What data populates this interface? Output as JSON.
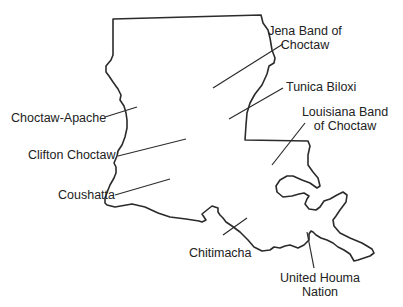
{
  "map": {
    "subject": "Louisiana",
    "line_color": "#2b2b2b",
    "label_color": "#222222",
    "labels": [
      {
        "id": "jena",
        "line1": "Jena Band of",
        "line2": "Choctaw"
      },
      {
        "id": "tunica",
        "line1": "Tunica Biloxi"
      },
      {
        "id": "louisiana-band",
        "line1": "Louisiana Band",
        "line2": "of Choctaw"
      },
      {
        "id": "choctaw-apache",
        "line1": "Choctaw-Apache"
      },
      {
        "id": "clifton",
        "line1": "Clifton Choctaw"
      },
      {
        "id": "coushatta",
        "line1": "Coushatta"
      },
      {
        "id": "chitimacha",
        "line1": "Chitimacha"
      },
      {
        "id": "houma",
        "line1": "United Houma",
        "line2": "Nation"
      }
    ]
  }
}
